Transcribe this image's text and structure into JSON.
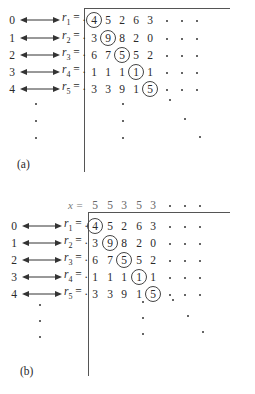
{
  "panels": [
    {
      "label": "(a)",
      "indices": [
        "0",
        "1",
        "2",
        "3",
        "4"
      ],
      "row_labels": [
        {
          "var": "r",
          "sub": "1",
          "suffix": " = ."
        },
        {
          "var": "r",
          "sub": "2",
          "suffix": " = ."
        },
        {
          "var": "r",
          "sub": "3",
          "suffix": " = ."
        },
        {
          "var": "r",
          "sub": "4",
          "suffix": " = ."
        },
        {
          "var": "r",
          "sub": "5",
          "suffix": " = ."
        }
      ],
      "digits": [
        [
          "4",
          "5",
          "2",
          "6",
          "3"
        ],
        [
          "3",
          "9",
          "8",
          "2",
          "0"
        ],
        [
          "6",
          "7",
          "5",
          "5",
          "2"
        ],
        [
          "1",
          "1",
          "1",
          "1",
          "1"
        ],
        [
          "3",
          "3",
          "9",
          "1",
          "5"
        ]
      ],
      "circled_diagonal": [
        "4",
        "9",
        "5",
        "1",
        "5"
      ],
      "continuation": "dots"
    },
    {
      "label": "(b)",
      "x_row_label": "x =",
      "x_digits": [
        "5",
        "5",
        "3",
        "5",
        "3"
      ],
      "indices": [
        "0",
        "1",
        "2",
        "3",
        "4"
      ],
      "row_labels": [
        {
          "var": "r",
          "sub": "1",
          "suffix": " = ."
        },
        {
          "var": "r",
          "sub": "2",
          "suffix": " = ."
        },
        {
          "var": "r",
          "sub": "3",
          "suffix": " = ."
        },
        {
          "var": "r",
          "sub": "4",
          "suffix": " = ."
        },
        {
          "var": "r",
          "sub": "5",
          "suffix": " = ."
        }
      ],
      "digits": [
        [
          "4",
          "5",
          "2",
          "6",
          "3"
        ],
        [
          "3",
          "9",
          "8",
          "2",
          "0"
        ],
        [
          "6",
          "7",
          "5",
          "5",
          "2"
        ],
        [
          "1",
          "1",
          "1",
          "1",
          "1"
        ],
        [
          "3",
          "3",
          "9",
          "1",
          "5"
        ]
      ],
      "circled_diagonal": [
        "4",
        "9",
        "5",
        "1",
        "5"
      ],
      "continuation": "dots"
    }
  ]
}
